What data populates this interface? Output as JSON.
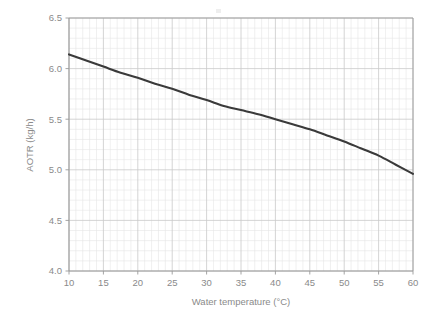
{
  "chart_data": {
    "type": "line",
    "title": "",
    "subtitle": "",
    "xlabel": "Water temperature (°C)",
    "ylabel": "AOTR (kg/h)",
    "xlim": [
      10,
      60
    ],
    "ylim": [
      4.0,
      6.5
    ],
    "x_ticks": [
      10,
      15,
      20,
      25,
      30,
      35,
      40,
      45,
      50,
      55,
      60
    ],
    "x_tick_labels": [
      "10",
      "15",
      "20",
      "25",
      "30",
      "35",
      "40",
      "45",
      "50",
      "55",
      "60"
    ],
    "y_ticks": [
      4.0,
      4.5,
      5.0,
      5.5,
      6.0,
      6.5
    ],
    "y_tick_labels": [
      "4.0",
      "4.5",
      "5.0",
      "5.5",
      "6.0",
      "6.5"
    ],
    "grid": true,
    "grid_minor": true,
    "grid_minor_divisions": 5,
    "legend": null,
    "legend_position": "none",
    "annotations": [],
    "series": [
      {
        "name": "AOTR vs water temperature",
        "color": "#3a3a3a",
        "line_width": 2.1,
        "x": [
          10,
          12.5,
          15,
          17.5,
          20,
          22.5,
          25,
          27.5,
          30,
          32.5,
          35,
          37.5,
          40,
          42.5,
          45,
          47.5,
          50,
          52.5,
          55,
          57.5,
          60
        ],
        "values": [
          6.14,
          6.08,
          6.02,
          5.96,
          5.91,
          5.85,
          5.8,
          5.74,
          5.69,
          5.63,
          5.59,
          5.55,
          5.5,
          5.45,
          5.4,
          5.34,
          5.28,
          5.21,
          5.14,
          5.05,
          4.96
        ]
      }
    ]
  },
  "axes": {
    "x_axis_name": "water-temperature-axis",
    "y_axis_name": "aotr-axis"
  },
  "colors": {
    "curve": "#3a3a3a",
    "axis": "#9a9a9a",
    "grid_major": "#c9c9c9",
    "grid_minor": "#e6e6e6",
    "text": "#8a8a8a",
    "background": "#ffffff"
  }
}
